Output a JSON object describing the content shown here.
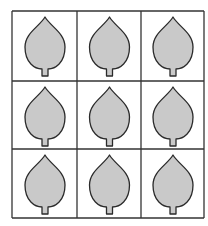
{
  "figure": {
    "rows": 3,
    "cols": 3,
    "grid_x": [
      12,
      77,
      141,
      204
    ],
    "grid_y": [
      11,
      81,
      149,
      218
    ],
    "leaf_fill": "#c9c9c9",
    "leaf_stroke": "#2a2a2a",
    "grid_stroke": "#333333",
    "cells": [
      {
        "row": 0,
        "col": 0,
        "shape": "leaf"
      },
      {
        "row": 0,
        "col": 1,
        "shape": "leaf"
      },
      {
        "row": 0,
        "col": 2,
        "shape": "leaf"
      },
      {
        "row": 1,
        "col": 0,
        "shape": "leaf"
      },
      {
        "row": 1,
        "col": 1,
        "shape": "leaf"
      },
      {
        "row": 1,
        "col": 2,
        "shape": "leaf"
      },
      {
        "row": 2,
        "col": 0,
        "shape": "leaf"
      },
      {
        "row": 2,
        "col": 1,
        "shape": "leaf"
      },
      {
        "row": 2,
        "col": 2,
        "shape": "leaf"
      }
    ]
  }
}
